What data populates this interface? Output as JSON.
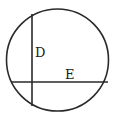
{
  "diagram": {
    "type": "circle-with-chords",
    "labels": {
      "vertical_chord": "D",
      "horizontal_chord": "E"
    },
    "colors": {
      "stroke": "#2a2a2a",
      "background": "#ffffff"
    }
  }
}
